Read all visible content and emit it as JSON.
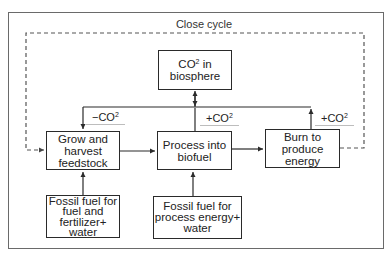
{
  "diagram": {
    "close_cycle_label": "Close cycle",
    "nodes": {
      "co2_biosphere": {
        "line1_prefix": "CO",
        "line1_sup": "2",
        "line1_suffix": " in",
        "line2": "biosphere"
      },
      "grow": {
        "lines": [
          "Grow and",
          "harvest",
          "feedstock"
        ]
      },
      "process": {
        "lines": [
          "Process into",
          "biofuel"
        ]
      },
      "burn": {
        "lines": [
          "Burn to",
          "produce",
          "energy"
        ]
      },
      "fossil_fuel_grow": {
        "lines": [
          "Fossil fuel for",
          "fuel and",
          "fertilizer+",
          "water"
        ]
      },
      "fossil_fuel_process": {
        "lines": [
          "Fossil fuel for",
          "process energy+",
          "water"
        ]
      }
    },
    "edge_labels": {
      "grow_co2": {
        "prefix": "−CO",
        "sup": "2"
      },
      "process_co2": {
        "prefix": "+CO",
        "sup": "2"
      },
      "burn_co2": {
        "prefix": "+CO",
        "sup": "2"
      }
    },
    "edges": [
      {
        "from": "co2_biosphere",
        "to": "grow",
        "label": "-CO2"
      },
      {
        "from": "process",
        "to": "co2_biosphere",
        "label": "+CO2"
      },
      {
        "from": "burn",
        "to": "co2_biosphere",
        "label": "+CO2"
      },
      {
        "from": "grow",
        "to": "process"
      },
      {
        "from": "process",
        "to": "burn"
      },
      {
        "from": "fossil_fuel_grow",
        "to": "grow"
      },
      {
        "from": "fossil_fuel_process",
        "to": "process"
      },
      {
        "from": "burn",
        "to": "grow",
        "style": "dashed",
        "label": "Close cycle"
      }
    ],
    "colors": {
      "line": "#2a2a2a",
      "dashed": "#555555",
      "frame": "#6a6a6a"
    }
  }
}
